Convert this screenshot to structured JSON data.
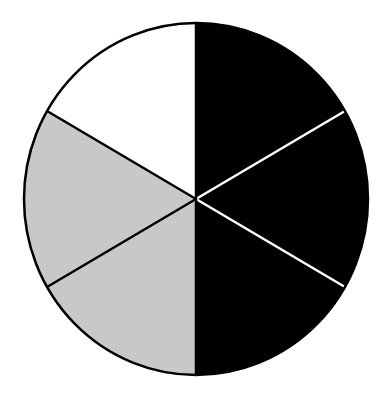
{
  "chart_data": {
    "type": "pie",
    "title": "",
    "center": [
      196,
      199
    ],
    "radius": [
      172,
      176
    ],
    "start_angle_deg": -90,
    "direction": "clockwise",
    "slices": [
      {
        "label": "",
        "value": 1,
        "fraction": 0.1667,
        "color": "#000000"
      },
      {
        "label": "",
        "value": 1,
        "fraction": 0.1667,
        "color": "#000000"
      },
      {
        "label": "",
        "value": 1,
        "fraction": 0.1667,
        "color": "#000000"
      },
      {
        "label": "",
        "value": 1,
        "fraction": 0.1667,
        "color": "#c8c8c8"
      },
      {
        "label": "",
        "value": 1,
        "fraction": 0.1667,
        "color": "#c8c8c8"
      },
      {
        "label": "",
        "value": 1,
        "fraction": 0.1667,
        "color": "#ffffff"
      }
    ],
    "separators": [
      {
        "between": [
          0,
          1
        ],
        "color": "#ffffff"
      },
      {
        "between": [
          1,
          2
        ],
        "color": "#ffffff"
      },
      {
        "between": [
          2,
          3
        ],
        "color": "#000000"
      },
      {
        "between": [
          3,
          4
        ],
        "color": "#000000"
      },
      {
        "between": [
          4,
          5
        ],
        "color": "#000000"
      },
      {
        "between": [
          5,
          0
        ],
        "color": "#000000"
      }
    ],
    "outline_color": "#000000",
    "legend": null,
    "summary": {
      "black_fraction": "3/6",
      "gray_fraction": "2/6",
      "white_fraction": "1/6"
    }
  }
}
